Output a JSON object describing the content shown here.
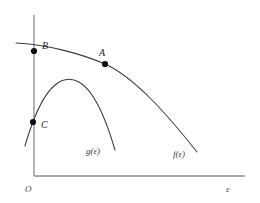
{
  "figure": {
    "caption_ghost": "",
    "background_color": "#ffffff",
    "axis_color": "#8d8d93",
    "curve_color": "#3c3c3c",
    "point_color": "#111111"
  },
  "axes": {
    "origin_label": "O",
    "x_axis_label": "ε",
    "y_axis_label": "",
    "x_axis": {
      "x_start": 34,
      "x_end": 245,
      "y": 176
    },
    "y_axis": {
      "x": 34,
      "y_start": 15,
      "y_end": 176
    }
  },
  "points": [
    {
      "id": "A",
      "label": "A",
      "x": 105,
      "y": 64,
      "label_x": 99,
      "label_y": 56,
      "radius": 3.1,
      "curve": "f"
    },
    {
      "id": "B",
      "label": "B",
      "x": 34,
      "y": 51,
      "label_x": 42,
      "label_y": 49,
      "radius": 3.1,
      "curve": "f"
    },
    {
      "id": "C",
      "label": "C",
      "x": 33,
      "y": 122,
      "label_x": 41,
      "label_y": 128,
      "radius": 3.1,
      "curve": "g"
    }
  ],
  "curves": [
    {
      "id": "f",
      "label": "f(ε)",
      "label_x": 173,
      "label_y": 157,
      "path": "M 16 43 C 45 44, 82 54, 105 64 C 134 77, 166 113, 197 152",
      "description": "concave curve peaking at point A, crossing the y-axis at point B"
    },
    {
      "id": "g",
      "label": "g(ε)",
      "label_x": 86,
      "label_y": 154,
      "path": "M 25 146 C 29 132, 31 127, 33 122 C 46 87, 62 73, 79 82 C 95 91, 106 119, 115 150",
      "description": "curve rising through point C, arcing over and descending steeply"
    }
  ],
  "chart_data": {
    "type": "line",
    "title": "",
    "xlabel": "ε",
    "ylabel": "",
    "grid": false,
    "legend": "inline-curve-labels",
    "series": [
      {
        "name": "f(ε)",
        "annotations": [
          "B",
          "A"
        ],
        "points": [
          [
            16,
            43
          ],
          [
            45,
            44
          ],
          [
            70,
            51
          ],
          [
            105,
            64
          ],
          [
            140,
            86
          ],
          [
            170,
            116
          ],
          [
            197,
            152
          ]
        ]
      },
      {
        "name": "g(ε)",
        "annotations": [
          "C"
        ],
        "points": [
          [
            25,
            146
          ],
          [
            33,
            122
          ],
          [
            50,
            94
          ],
          [
            67,
            80
          ],
          [
            79,
            82
          ],
          [
            95,
            101
          ],
          [
            115,
            150
          ]
        ]
      }
    ],
    "marked_points": [
      {
        "label": "A",
        "series": "f(ε)",
        "x": 105,
        "y": 64
      },
      {
        "label": "B",
        "series": "f(ε)",
        "x": 34,
        "y": 51
      },
      {
        "label": "C",
        "series": "g(ε)",
        "x": 33,
        "y": 122
      }
    ],
    "intersection": {
      "x": 67,
      "y": 80
    },
    "axis_origin_label": "O"
  }
}
